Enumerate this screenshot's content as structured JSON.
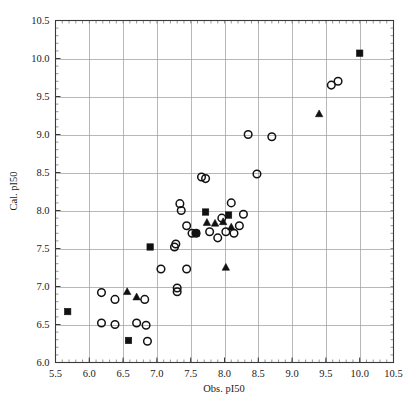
{
  "chart_data": {
    "type": "scatter",
    "title": "",
    "xlabel": "Obs. pI50",
    "ylabel": "Cal. pI50",
    "xlim": [
      5.5,
      10.5
    ],
    "ylim": [
      6.0,
      10.5
    ],
    "xticks": [
      "5.5",
      "6.0",
      "6.5",
      "7.0",
      "7.5",
      "8.0",
      "8.5",
      "9.0",
      "9.5",
      "10.0",
      "10.5"
    ],
    "yticks": [
      "6.0",
      "6.5",
      "7.0",
      "7.5",
      "8.0",
      "8.5",
      "9.0",
      "9.5",
      "10.0",
      "10.5"
    ],
    "xtick_values": [
      5.5,
      6.0,
      6.5,
      7.0,
      7.5,
      8.0,
      8.5,
      9.0,
      9.5,
      10.0,
      10.5
    ],
    "ytick_values": [
      6.0,
      6.5,
      7.0,
      7.5,
      8.0,
      8.5,
      9.0,
      9.5,
      10.0,
      10.5
    ],
    "grid": true,
    "legend": "none",
    "series": [
      {
        "name": "open-circle",
        "marker": "circle",
        "points": [
          [
            6.18,
            6.92
          ],
          [
            6.18,
            6.52
          ],
          [
            6.38,
            6.83
          ],
          [
            6.38,
            6.5
          ],
          [
            6.7,
            6.52
          ],
          [
            6.82,
            6.83
          ],
          [
            6.84,
            6.49
          ],
          [
            6.86,
            6.28
          ],
          [
            7.06,
            7.23
          ],
          [
            7.26,
            7.52
          ],
          [
            7.28,
            7.56
          ],
          [
            7.3,
            6.98
          ],
          [
            7.3,
            6.93
          ],
          [
            7.34,
            8.09
          ],
          [
            7.36,
            8.0
          ],
          [
            7.44,
            7.8
          ],
          [
            7.44,
            7.23
          ],
          [
            7.52,
            7.7
          ],
          [
            7.58,
            7.7
          ],
          [
            7.66,
            8.44
          ],
          [
            7.72,
            8.42
          ],
          [
            7.78,
            7.72
          ],
          [
            7.9,
            7.64
          ],
          [
            7.96,
            7.9
          ],
          [
            8.02,
            7.72
          ],
          [
            8.1,
            8.1
          ],
          [
            8.14,
            7.7
          ],
          [
            8.22,
            7.8
          ],
          [
            8.28,
            7.95
          ],
          [
            8.35,
            9.0
          ],
          [
            8.48,
            8.48
          ],
          [
            8.7,
            8.97
          ],
          [
            9.58,
            9.65
          ],
          [
            9.68,
            9.7
          ]
        ]
      },
      {
        "name": "filled-square",
        "marker": "square",
        "points": [
          [
            5.68,
            6.67
          ],
          [
            6.58,
            6.29
          ],
          [
            6.9,
            7.52
          ],
          [
            7.58,
            7.7
          ],
          [
            7.72,
            7.98
          ],
          [
            8.06,
            7.94
          ],
          [
            10.0,
            10.07
          ]
        ]
      },
      {
        "name": "filled-triangle",
        "marker": "triangle",
        "points": [
          [
            6.56,
            6.93
          ],
          [
            6.7,
            6.86
          ],
          [
            7.74,
            7.84
          ],
          [
            7.86,
            7.83
          ],
          [
            7.98,
            7.85
          ],
          [
            8.1,
            7.78
          ],
          [
            8.02,
            7.25
          ],
          [
            9.4,
            9.27
          ]
        ]
      }
    ]
  },
  "axes": {
    "x_title": "Obs. pI50",
    "y_title": "Cal. pI50"
  }
}
